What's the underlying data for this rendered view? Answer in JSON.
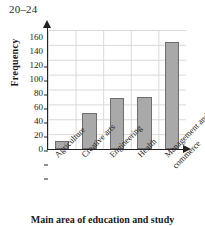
{
  "chart_data": {
    "type": "bar",
    "title": "20–24",
    "xlabel": "Main area of education and study",
    "ylabel": "Frequency",
    "categories": [
      "Agriculture",
      "Creative arts",
      "Engineering",
      "Health",
      "Management and\ncommerce"
    ],
    "values": [
      11,
      52,
      73,
      75,
      153
    ],
    "ylim": [
      0,
      170
    ],
    "yticks": [
      0,
      20,
      40,
      60,
      80,
      100,
      120,
      140,
      160
    ],
    "ytick_labels": [
      "0",
      "20",
      "40",
      "60",
      "80",
      "100",
      "120",
      "140",
      "160"
    ],
    "grid": true,
    "legend": false,
    "bar_color": "#a9a9a9",
    "bar_edge_color": "#6e6e6e",
    "grid_color": "#d9d9d9",
    "axis_color": "#222222"
  }
}
